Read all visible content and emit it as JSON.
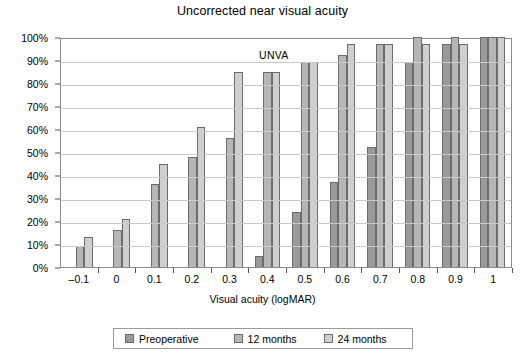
{
  "chart_data": {
    "type": "bar",
    "title": "Uncorrected near visual acuity",
    "xlabel": "Visual acuity (logMAR)",
    "ylabel": "",
    "annotation": "UNVA",
    "categories": [
      "-0.1",
      "0",
      "0.1",
      "0.2",
      "0.3",
      "0.4",
      "0.5",
      "0.6",
      "0.7",
      "0.8",
      "0.9",
      "1"
    ],
    "series": [
      {
        "name": "Preoperative",
        "color": "#9a9a9a",
        "values": [
          0,
          0,
          0,
          0,
          0,
          5,
          24,
          37,
          52,
          89,
          97,
          100
        ]
      },
      {
        "name": "12 months",
        "color": "#b6b6b6",
        "values": [
          9,
          16,
          36,
          48,
          56,
          85,
          89,
          92,
          97,
          100,
          100,
          100
        ]
      },
      {
        "name": "24 months",
        "color": "#cfcfcf",
        "values": [
          13,
          21,
          45,
          61,
          85,
          85,
          89,
          97,
          97,
          97,
          97,
          100
        ]
      }
    ],
    "ylim": [
      0,
      100
    ],
    "ytick_labels": [
      "100%",
      "90%",
      "80%",
      "70%",
      "60%",
      "50%",
      "40%",
      "30%",
      "20%",
      "10%",
      "0%"
    ],
    "ytick_values": [
      100,
      90,
      80,
      70,
      60,
      50,
      40,
      30,
      20,
      10,
      0
    ],
    "grid": true,
    "legend_position": "bottom"
  },
  "legend": {
    "items": [
      {
        "label": "Preoperative"
      },
      {
        "label": "12 months"
      },
      {
        "label": "24 months"
      }
    ]
  }
}
